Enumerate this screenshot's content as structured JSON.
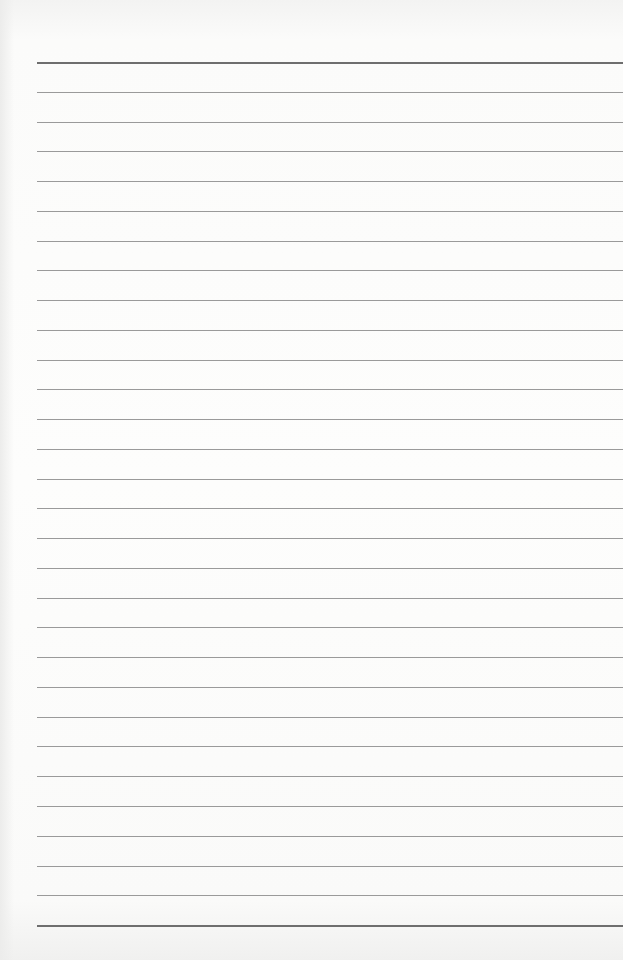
{
  "page": {
    "type": "ruled-paper",
    "background_color": "#fdfdfc",
    "rule_color": "#9a9a9a",
    "heavy_rule_color": "#6e6e6e",
    "rule_count": 30,
    "first_rule_y": 62,
    "rule_spacing": 29.76,
    "rule_left": 37,
    "heavy_rules": [
      0,
      29
    ]
  }
}
